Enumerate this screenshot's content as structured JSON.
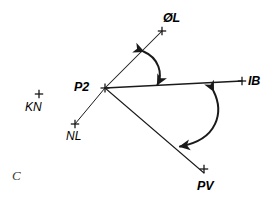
{
  "figure": {
    "caption_letter": "C",
    "background_color": "#ffffff",
    "stroke_color": "#1a1a1a",
    "width": 277,
    "height": 203,
    "vertex": {
      "name": "P2",
      "label": "P2",
      "x": 105,
      "y": 88,
      "label_x": 74,
      "label_y": 81
    },
    "points": [
      {
        "id": "ol",
        "label": "ØL",
        "marker_x": 162,
        "marker_y": 31,
        "label_x": 163,
        "label_y": 12,
        "weight": "bold",
        "connected_to_vertex": true
      },
      {
        "id": "ib",
        "label": "IB",
        "marker_x": 242,
        "marker_y": 81,
        "label_x": 248,
        "label_y": 75,
        "weight": "bold",
        "connected_to_vertex": true
      },
      {
        "id": "pv",
        "label": "PV",
        "marker_x": 204,
        "marker_y": 173,
        "label_x": 197,
        "label_y": 180,
        "weight": "bold",
        "connected_to_vertex": true
      },
      {
        "id": "nl",
        "label": "NL",
        "marker_x": 75,
        "marker_y": 124,
        "label_x": 66,
        "label_y": 130,
        "weight": "normal",
        "connected_to_vertex": true
      },
      {
        "id": "kn",
        "label": "KN",
        "marker_x": 39,
        "marker_y": 94,
        "label_x": 25,
        "label_y": 101,
        "weight": "normal",
        "connected_to_vertex": false
      }
    ],
    "rays": [
      {
        "id": "ray-p2-ol",
        "from": "P2",
        "to": "ØL"
      },
      {
        "id": "ray-p2-ib",
        "from": "P2",
        "to": "IB"
      },
      {
        "id": "ray-p2-pv",
        "from": "P2",
        "to": "PV"
      },
      {
        "id": "ray-p2-nl",
        "from": "P2",
        "to": "NL"
      }
    ],
    "angle_arcs": [
      {
        "id": "angle-arc-ol-ib",
        "between": [
          "ØL",
          "IB"
        ],
        "double_headed": true
      },
      {
        "id": "angle-arc-ib-pv",
        "between": [
          "IB",
          "PV"
        ],
        "double_headed": true
      }
    ]
  }
}
